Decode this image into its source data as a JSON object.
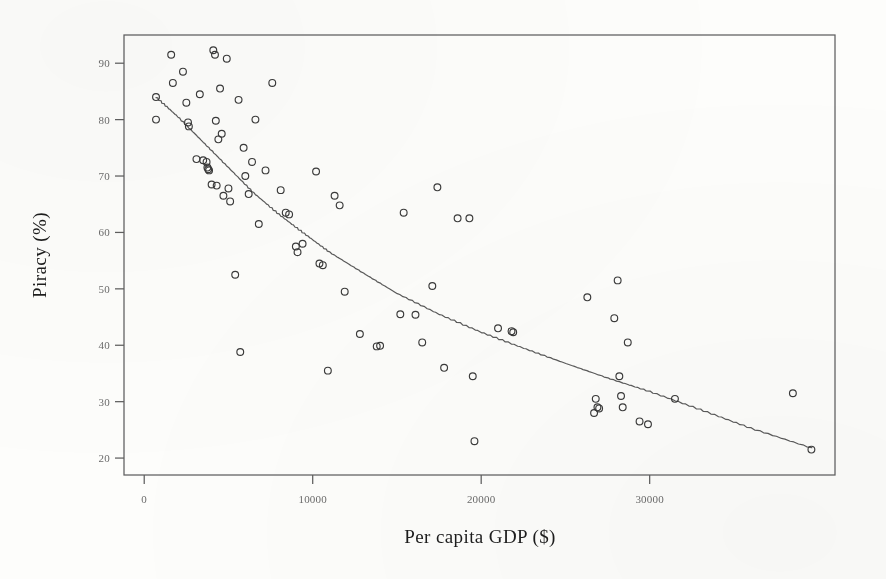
{
  "chart_data": {
    "type": "scatter",
    "title": "",
    "subtitle": "",
    "xlabel": "Per capita GDP ($)",
    "ylabel": "Piracy (%)",
    "xlim": [
      -1200,
      41000
    ],
    "ylim": [
      17,
      95
    ],
    "grid": false,
    "legend": null,
    "legend_position": "none",
    "marker_style": "open-circle",
    "x_ticks": [
      0,
      10000,
      20000,
      30000
    ],
    "x_tick_labels": [
      "0",
      "10000",
      "20000",
      "30000"
    ],
    "y_ticks": [
      20,
      30,
      40,
      50,
      60,
      70,
      80,
      90
    ],
    "y_tick_labels": [
      "20",
      "30",
      "40",
      "50",
      "60",
      "70",
      "80",
      "90"
    ],
    "points": [
      [
        700,
        84.0
      ],
      [
        700,
        80.0
      ],
      [
        1600,
        91.5
      ],
      [
        1700,
        86.5
      ],
      [
        2300,
        88.5
      ],
      [
        2500,
        83.0
      ],
      [
        2600,
        79.5
      ],
      [
        2650,
        78.8
      ],
      [
        3100,
        73.0
      ],
      [
        3300,
        84.5
      ],
      [
        3500,
        72.8
      ],
      [
        3700,
        72.5
      ],
      [
        3750,
        71.5
      ],
      [
        3800,
        71.2
      ],
      [
        3850,
        71.0
      ],
      [
        4000,
        68.5
      ],
      [
        4100,
        92.3
      ],
      [
        4200,
        91.5
      ],
      [
        4250,
        79.8
      ],
      [
        4300,
        68.3
      ],
      [
        4400,
        76.5
      ],
      [
        4500,
        85.5
      ],
      [
        4600,
        77.5
      ],
      [
        4700,
        66.5
      ],
      [
        4900,
        90.8
      ],
      [
        5000,
        67.8
      ],
      [
        5100,
        65.5
      ],
      [
        5400,
        52.5
      ],
      [
        5600,
        83.5
      ],
      [
        5700,
        38.8
      ],
      [
        5900,
        75.0
      ],
      [
        6000,
        70.0
      ],
      [
        6200,
        66.8
      ],
      [
        6400,
        72.5
      ],
      [
        6600,
        80.0
      ],
      [
        6800,
        61.5
      ],
      [
        7200,
        71.0
      ],
      [
        7600,
        86.5
      ],
      [
        8100,
        67.5
      ],
      [
        8400,
        63.5
      ],
      [
        8600,
        63.2
      ],
      [
        9000,
        57.5
      ],
      [
        9100,
        56.5
      ],
      [
        9400,
        58.0
      ],
      [
        10200,
        70.8
      ],
      [
        10400,
        54.5
      ],
      [
        10600,
        54.2
      ],
      [
        10900,
        35.5
      ],
      [
        11300,
        66.5
      ],
      [
        11600,
        64.8
      ],
      [
        11900,
        49.5
      ],
      [
        12800,
        42.0
      ],
      [
        13800,
        39.8
      ],
      [
        14000,
        39.9
      ],
      [
        15200,
        45.5
      ],
      [
        15400,
        63.5
      ],
      [
        16100,
        45.4
      ],
      [
        16500,
        40.5
      ],
      [
        17100,
        50.5
      ],
      [
        17400,
        68.0
      ],
      [
        17800,
        36.0
      ],
      [
        18600,
        62.5
      ],
      [
        19300,
        62.5
      ],
      [
        19500,
        34.5
      ],
      [
        19600,
        23.0
      ],
      [
        21000,
        43.0
      ],
      [
        21800,
        42.5
      ],
      [
        21900,
        42.3
      ],
      [
        26300,
        48.5
      ],
      [
        26700,
        28.0
      ],
      [
        26800,
        30.5
      ],
      [
        26900,
        29.0
      ],
      [
        27000,
        28.8
      ],
      [
        27900,
        44.8
      ],
      [
        28100,
        51.5
      ],
      [
        28200,
        34.5
      ],
      [
        28300,
        31.0
      ],
      [
        28400,
        29.0
      ],
      [
        28700,
        40.5
      ],
      [
        29400,
        26.5
      ],
      [
        29900,
        26.0
      ],
      [
        31500,
        30.5
      ],
      [
        38500,
        31.5
      ],
      [
        39600,
        21.5
      ]
    ],
    "trend_line": {
      "style": "fitted-curve",
      "x": [
        700,
        2000,
        3500,
        5000,
        6500,
        8000,
        9500,
        11000,
        13000,
        15000,
        17500,
        20000,
        22500,
        25000,
        27500,
        30000,
        33000,
        36000,
        39600
      ],
      "y": [
        84.0,
        80.5,
        76.0,
        71.5,
        67.0,
        63.2,
        59.8,
        56.5,
        52.8,
        49.2,
        45.5,
        42.3,
        39.5,
        36.8,
        34.2,
        31.8,
        28.6,
        25.3,
        21.8
      ]
    }
  }
}
